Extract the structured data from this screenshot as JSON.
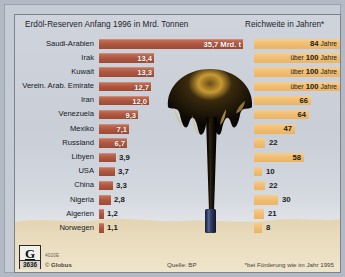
{
  "header": {
    "left_title": "Erdöl-Reserven Anfang 1996 in Mrd. Tonnen",
    "right_title": "Reichweite in Jahren*"
  },
  "footer": {
    "logo_letter": "G",
    "logo_number": "3636",
    "code": "4020E",
    "copyright_symbol": "©",
    "copyright": "Globus",
    "source": "Quelle: BP",
    "note": "*bei Förderung wie im Jahr 1995"
  },
  "colors": {
    "reserve_bar": "#b0563f",
    "range_bar": "#f0bd72",
    "panel_bg": "#c9ced7",
    "sand": "#e9dcbd",
    "oil": "#120d06"
  },
  "chart_data": {
    "type": "bar",
    "title": "Erdöl-Reserven Anfang 1996 in Mrd. Tonnen",
    "xlabel": "",
    "ylabel": "",
    "grid": false,
    "legend": "none",
    "categories": [
      "Saudi-Arabien",
      "Irak",
      "Kuwait",
      "Verein. Arab. Emirate",
      "Iran",
      "Venezuela",
      "Mexiko",
      "Russland",
      "Libyen",
      "USA",
      "China",
      "Nigeria",
      "Algerien",
      "Norwegen"
    ],
    "series": [
      {
        "name": "Erdöl-Reserven Anfang 1996 in Mrd. Tonnen",
        "unit": "Mrd. t",
        "color": "#b0563f",
        "values": [
          35.7,
          13.4,
          13.3,
          12.7,
          12.0,
          9.3,
          7.1,
          6.7,
          3.9,
          3.7,
          3.3,
          2.8,
          1.2,
          1.1
        ],
        "labels": [
          "35,7 Mrd. t",
          "13,4",
          "13,3",
          "12,7",
          "12,0",
          "9,3",
          "7,1",
          "6,7",
          "3,9",
          "3,7",
          "3,3",
          "2,8",
          "1,2",
          "1,1"
        ]
      },
      {
        "name": "Reichweite in Jahren*",
        "unit": "Jahre",
        "color": "#f0bd72",
        "values": [
          84,
          100,
          100,
          100,
          66,
          64,
          47,
          22,
          58,
          10,
          22,
          30,
          21,
          8
        ],
        "labels": [
          "84 Jahre",
          "über 100 Jahre",
          "über 100 Jahre",
          "über 100 Jahre",
          "66",
          "64",
          "47",
          "22",
          "58",
          "10",
          "22",
          "30",
          "21",
          "8"
        ]
      }
    ]
  },
  "rows": [
    {
      "label": "Saudi-Arabien",
      "reserve": "35,7 Mrd. t",
      "reserve_w": 144,
      "reserve_inside": true,
      "range_prefix": "",
      "range_value": "84",
      "range_suffix": "Jahre",
      "range_w": 86,
      "range_inside": true
    },
    {
      "label": "Irak",
      "reserve": "13,4",
      "reserve_w": 55,
      "reserve_inside": true,
      "range_prefix": "über",
      "range_value": "100",
      "range_suffix": "Jahre",
      "range_w": 86,
      "range_inside": true
    },
    {
      "label": "Kuwait",
      "reserve": "13,3",
      "reserve_w": 55,
      "reserve_inside": true,
      "range_prefix": "über",
      "range_value": "100",
      "range_suffix": "Jahre",
      "range_w": 86,
      "range_inside": true
    },
    {
      "label": "Verein. Arab. Emirate",
      "reserve": "12,7",
      "reserve_w": 52,
      "reserve_inside": true,
      "range_prefix": "über",
      "range_value": "100",
      "range_suffix": "Jahre",
      "range_w": 86,
      "range_inside": true
    },
    {
      "label": "Iran",
      "reserve": "12,0",
      "reserve_w": 50,
      "reserve_inside": true,
      "range_prefix": "",
      "range_value": "66",
      "range_suffix": "",
      "range_w": 57,
      "range_inside": true
    },
    {
      "label": "Venezuela",
      "reserve": "9,3",
      "reserve_w": 39,
      "reserve_inside": true,
      "range_prefix": "",
      "range_value": "64",
      "range_suffix": "",
      "range_w": 55,
      "range_inside": true
    },
    {
      "label": "Mexiko",
      "reserve": "7,1",
      "reserve_w": 30,
      "reserve_inside": true,
      "range_prefix": "",
      "range_value": "47",
      "range_suffix": "",
      "range_w": 41,
      "range_inside": true
    },
    {
      "label": "Russland",
      "reserve": "6,7",
      "reserve_w": 28,
      "reserve_inside": true,
      "range_prefix": "",
      "range_value": "22",
      "range_suffix": "",
      "range_w": 11,
      "range_inside": false
    },
    {
      "label": "Libyen",
      "reserve": "3,9",
      "reserve_w": 17,
      "reserve_inside": false,
      "range_prefix": "",
      "range_value": "58",
      "range_suffix": "",
      "range_w": 50,
      "range_inside": true
    },
    {
      "label": "USA",
      "reserve": "3,7",
      "reserve_w": 16,
      "reserve_inside": false,
      "range_prefix": "",
      "range_value": "10",
      "range_suffix": "",
      "range_w": 8,
      "range_inside": false
    },
    {
      "label": "China",
      "reserve": "3,3",
      "reserve_w": 14,
      "reserve_inside": false,
      "range_prefix": "",
      "range_value": "22",
      "range_suffix": "",
      "range_w": 11,
      "range_inside": false
    },
    {
      "label": "Nigeria",
      "reserve": "2,8",
      "reserve_w": 12,
      "reserve_inside": false,
      "range_prefix": "",
      "range_value": "30",
      "range_suffix": "",
      "range_w": 24,
      "range_inside": false
    },
    {
      "label": "Algerien",
      "reserve": "1,2",
      "reserve_w": 5,
      "reserve_inside": false,
      "range_prefix": "",
      "range_value": "21",
      "range_suffix": "",
      "range_w": 10,
      "range_inside": false
    },
    {
      "label": "Norwegen",
      "reserve": "1,1",
      "reserve_w": 5,
      "reserve_inside": false,
      "range_prefix": "",
      "range_value": "8",
      "range_suffix": "",
      "range_w": 8,
      "range_inside": false
    }
  ]
}
